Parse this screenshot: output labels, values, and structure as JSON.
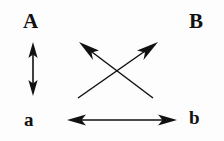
{
  "figure": {
    "title": "",
    "background_color": "#fdfdfd",
    "ink_color": "#111111",
    "width": 224,
    "height": 141
  },
  "labels": {
    "top_left": "A",
    "top_right": "B",
    "bottom_left": "a",
    "bottom_right": "b"
  },
  "arrows": [
    {
      "name": "vertical-double-arrow-A-a",
      "from": "A",
      "to": "a",
      "heads": "double",
      "orientation": "vertical",
      "x1": 33,
      "y1": 44,
      "x2": 33,
      "y2": 94
    },
    {
      "name": "horizontal-double-arrow-a-b",
      "from": "a",
      "to": "b",
      "heads": "double",
      "orientation": "horizontal",
      "x1": 69,
      "y1": 120,
      "x2": 175,
      "y2": 120
    },
    {
      "name": "diagonal-arrow-b-to-A",
      "from": "b",
      "to": "A",
      "heads": "single",
      "orientation": "diagonal-up-left",
      "x1": 153,
      "y1": 98,
      "x2": 80,
      "y2": 43
    },
    {
      "name": "diagonal-arrow-a-to-B",
      "from": "a",
      "to": "B",
      "heads": "single",
      "orientation": "diagonal-up-right",
      "x1": 78,
      "y1": 98,
      "x2": 157,
      "y2": 43
    }
  ],
  "crossing_point": {
    "x": 118,
    "y": 70
  }
}
